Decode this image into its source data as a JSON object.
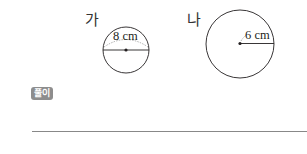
{
  "figures": [
    {
      "label": "가",
      "measurement": "8 cm",
      "measurement_type": "diameter"
    },
    {
      "label": "나",
      "measurement": "6 cm",
      "measurement_type": "radius"
    }
  ],
  "solution": {
    "badge_label": "풀이"
  }
}
